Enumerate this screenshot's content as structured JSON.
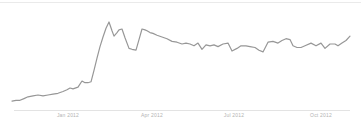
{
  "chart_data": {
    "type": "line",
    "title": "",
    "xlabel": "",
    "ylabel": "",
    "legend": "none",
    "grid": "off",
    "x_tick_labels": [
      "Jan 2012",
      "Apr 2012",
      "Jul 2012",
      "Oct 2012"
    ],
    "y_value_range": [
      0,
      100
    ],
    "series": [
      {
        "name": "interest-over-time",
        "color": "#979797",
        "points": [
          [
            12,
            10
          ],
          [
            16,
            11
          ],
          [
            20,
            11
          ],
          [
            24,
            13
          ],
          [
            28,
            15
          ],
          [
            33,
            16
          ],
          [
            38,
            17
          ],
          [
            43,
            16
          ],
          [
            48,
            17
          ],
          [
            53,
            18
          ],
          [
            58,
            19
          ],
          [
            63,
            21
          ],
          [
            67,
            23
          ],
          [
            70,
            25
          ],
          [
            73,
            24
          ],
          [
            78,
            26
          ],
          [
            82,
            33
          ],
          [
            85,
            31
          ],
          [
            88,
            31
          ],
          [
            91,
            32
          ],
          [
            94,
            45
          ],
          [
            97,
            59
          ],
          [
            100,
            72
          ],
          [
            103,
            83
          ],
          [
            106,
            93
          ],
          [
            109,
            100
          ],
          [
            112,
            90
          ],
          [
            114,
            84
          ],
          [
            117,
            88
          ],
          [
            119,
            91
          ],
          [
            122,
            92
          ],
          [
            125,
            82
          ],
          [
            129,
            70
          ],
          [
            132,
            69
          ],
          [
            136,
            68
          ],
          [
            139,
            80
          ],
          [
            142,
            92
          ],
          [
            145,
            91
          ],
          [
            147,
            90
          ],
          [
            150,
            88
          ],
          [
            153,
            87
          ],
          [
            157,
            85
          ],
          [
            162,
            83
          ],
          [
            167,
            81
          ],
          [
            172,
            78
          ],
          [
            177,
            77
          ],
          [
            182,
            75
          ],
          [
            186,
            76
          ],
          [
            190,
            75
          ],
          [
            194,
            73
          ],
          [
            198,
            76
          ],
          [
            202,
            69
          ],
          [
            206,
            74
          ],
          [
            210,
            73
          ],
          [
            214,
            74
          ],
          [
            218,
            72
          ],
          [
            223,
            75
          ],
          [
            228,
            76
          ],
          [
            232,
            67
          ],
          [
            237,
            70
          ],
          [
            241,
            73
          ],
          [
            246,
            73
          ],
          [
            250,
            72
          ],
          [
            255,
            71
          ],
          [
            259,
            68
          ],
          [
            263,
            66
          ],
          [
            268,
            77
          ],
          [
            273,
            78
          ],
          [
            278,
            76
          ],
          [
            282,
            79
          ],
          [
            286,
            81
          ],
          [
            290,
            80
          ],
          [
            293,
            73
          ],
          [
            297,
            71
          ],
          [
            301,
            71
          ],
          [
            305,
            73
          ],
          [
            311,
            76
          ],
          [
            316,
            73
          ],
          [
            321,
            76
          ],
          [
            325,
            70
          ],
          [
            330,
            75
          ],
          [
            335,
            75
          ],
          [
            338,
            73
          ],
          [
            342,
            76
          ],
          [
            346,
            79
          ],
          [
            350,
            84
          ]
        ]
      }
    ],
    "plot_px": {
      "x_min": 12,
      "x_max": 352,
      "baseline_y": 110,
      "top_y": 22
    },
    "axis_color": "#e3e3e3",
    "top_border_color": "#eaeaea",
    "label_color": "#b3b3b3"
  }
}
